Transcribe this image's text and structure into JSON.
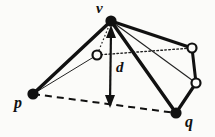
{
  "figure": {
    "type": "diagram",
    "width": 215,
    "height": 137,
    "background": "#fbfbf9",
    "ink_color": "#111111"
  },
  "labels": {
    "v": "v",
    "p": "p",
    "q": "q",
    "d": "d"
  },
  "nodes": [
    {
      "id": "v",
      "kind": "filled",
      "x": 111,
      "y": 21,
      "r": 5.5,
      "label": "v"
    },
    {
      "id": "p",
      "kind": "filled",
      "x": 33,
      "y": 94,
      "r": 5.5,
      "label": "p"
    },
    {
      "id": "q",
      "kind": "filled",
      "x": 176,
      "y": 113,
      "r": 5.5,
      "label": "q"
    },
    {
      "id": "c1",
      "kind": "hollow",
      "x": 97,
      "y": 55,
      "r": 4.5,
      "label": ""
    },
    {
      "id": "c2",
      "kind": "hollow",
      "x": 192,
      "y": 48,
      "r": 4.5,
      "label": ""
    },
    {
      "id": "c3",
      "kind": "hollow",
      "x": 196,
      "y": 83,
      "r": 4.5,
      "label": ""
    }
  ],
  "edges": [
    {
      "from": "v",
      "to": "p",
      "style": "thick"
    },
    {
      "from": "v",
      "to": "c2",
      "style": "thick"
    },
    {
      "from": "v",
      "to": "q",
      "style": "thick"
    },
    {
      "from": "c2",
      "to": "c3",
      "style": "thick"
    },
    {
      "from": "c3",
      "to": "q",
      "style": "thick"
    },
    {
      "from": "v",
      "to": "c3",
      "style": "thin"
    },
    {
      "from": "v",
      "to": "c1",
      "style": "thin"
    },
    {
      "from": "p",
      "to": "c1",
      "style": "thin"
    },
    {
      "from": "p",
      "to": "v",
      "style": "thin"
    },
    {
      "from": "c1",
      "to": "c2",
      "style": "dotted"
    },
    {
      "from": "p",
      "to": "q",
      "style": "dashed"
    }
  ],
  "measure": {
    "name": "d",
    "from_x": 111,
    "from_y": 29,
    "to_x": 110,
    "to_y": 105,
    "arrowheads": "both",
    "label": "d"
  }
}
